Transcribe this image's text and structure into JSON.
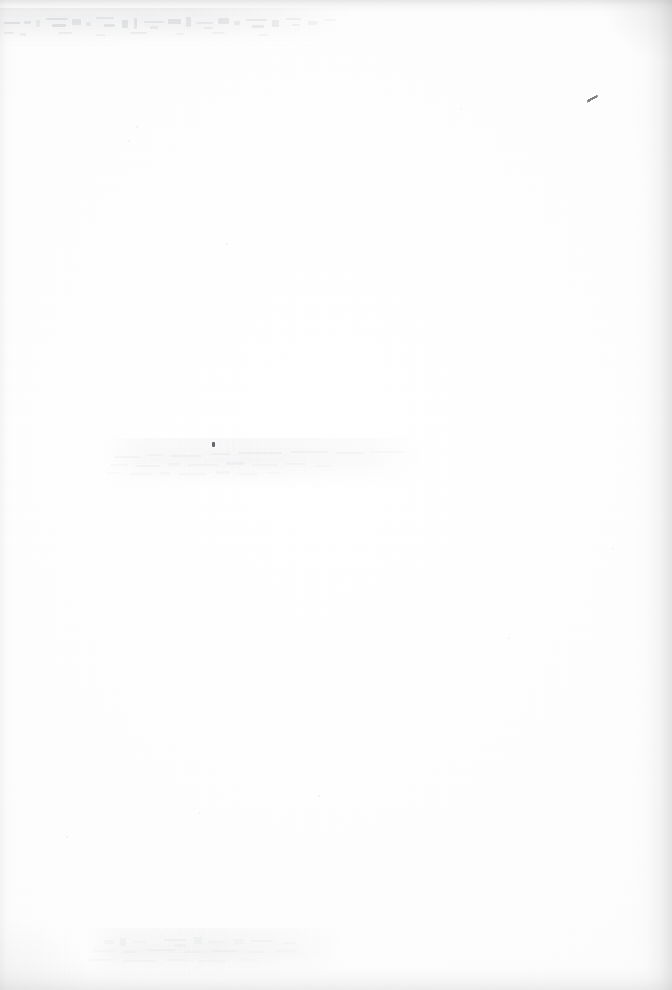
{
  "page": {
    "kind": "scanned-document-page",
    "content_state": "blank",
    "width": 672,
    "height": 990,
    "visible_text": "",
    "caption": "Blank scanned page with faint bleed-through marks"
  },
  "colors": {
    "paper": "#ffffff",
    "paper_tint": "#fdfdfd",
    "edge_shadow": "#b0b0b2",
    "ghost_ink": "#787a82",
    "ink_dark": "#4a4c54",
    "speck": "#c8c9cd"
  },
  "artifacts": {
    "ghost_bands": [
      {
        "name": "top-bleed-through-band",
        "x": 0,
        "y": 8,
        "width": 352,
        "height": 40,
        "opacity": 0.3,
        "note": "offset ghost text from facing page, illegible"
      },
      {
        "name": "middle-smudge-band",
        "x": 104,
        "y": 438,
        "width": 320,
        "height": 52,
        "opacity": 0.2,
        "note": "faint horizontal smudge rows, illegible"
      },
      {
        "name": "bottom-smudge-band",
        "x": 88,
        "y": 928,
        "width": 258,
        "height": 50,
        "opacity": 0.18,
        "note": "faint horizontal smudge rows, illegible"
      }
    ],
    "ink_marks": [
      {
        "name": "ink-tick-right",
        "x": 587,
        "y": 94
      },
      {
        "name": "ink-dot-mid",
        "x": 212,
        "y": 442
      }
    ],
    "specks": [
      {
        "x": 136,
        "y": 126,
        "size": 2.0,
        "opacity": 0.26
      },
      {
        "x": 128,
        "y": 140,
        "size": 1.6,
        "opacity": 0.22
      },
      {
        "x": 178,
        "y": 172,
        "size": 1.4,
        "opacity": 0.18
      },
      {
        "x": 226,
        "y": 243,
        "size": 1.6,
        "opacity": 0.2
      },
      {
        "x": 254,
        "y": 250,
        "size": 1.3,
        "opacity": 0.16
      },
      {
        "x": 320,
        "y": 232,
        "size": 1.4,
        "opacity": 0.15
      },
      {
        "x": 460,
        "y": 108,
        "size": 1.5,
        "opacity": 0.17
      },
      {
        "x": 498,
        "y": 102,
        "size": 1.4,
        "opacity": 0.15
      },
      {
        "x": 286,
        "y": 355,
        "size": 1.3,
        "opacity": 0.14
      },
      {
        "x": 150,
        "y": 398,
        "size": 1.4,
        "opacity": 0.15
      },
      {
        "x": 612,
        "y": 548,
        "size": 1.5,
        "opacity": 0.16
      },
      {
        "x": 508,
        "y": 637,
        "size": 1.5,
        "opacity": 0.18
      },
      {
        "x": 318,
        "y": 795,
        "size": 1.6,
        "opacity": 0.2
      },
      {
        "x": 394,
        "y": 735,
        "size": 1.4,
        "opacity": 0.15
      },
      {
        "x": 198,
        "y": 812,
        "size": 1.5,
        "opacity": 0.17
      },
      {
        "x": 206,
        "y": 818,
        "size": 1.4,
        "opacity": 0.15
      },
      {
        "x": 66,
        "y": 836,
        "size": 1.6,
        "opacity": 0.2
      },
      {
        "x": 392,
        "y": 827,
        "size": 1.3,
        "opacity": 0.14
      },
      {
        "x": 90,
        "y": 906,
        "size": 1.4,
        "opacity": 0.15
      },
      {
        "x": 534,
        "y": 882,
        "size": 1.3,
        "opacity": 0.13
      }
    ]
  }
}
